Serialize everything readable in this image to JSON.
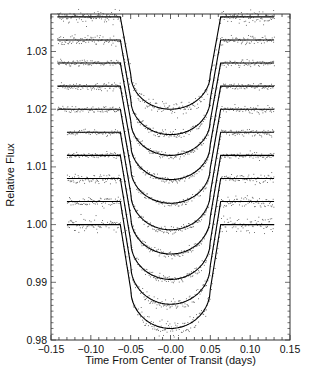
{
  "chart_data": {
    "type": "line",
    "title": "",
    "xlabel": "Time From Center of Transit (days)",
    "ylabel": "Relative Flux",
    "xlim": [
      -0.15,
      0.15
    ],
    "ylim": [
      0.98,
      1.0365
    ],
    "xticks": [
      -0.15,
      -0.1,
      -0.05,
      0.0,
      0.05,
      0.1,
      0.15
    ],
    "xtick_labels": [
      "−0.15",
      "−0.10",
      "−0.05",
      "−0.00",
      "0.05",
      "0.10",
      "0.15"
    ],
    "yticks": [
      0.98,
      0.99,
      1.0,
      1.01,
      1.02,
      1.03
    ],
    "ytick_labels": [
      "0.98",
      "0.99",
      "1.00",
      "1.01",
      "1.02",
      "1.03"
    ],
    "grid": false,
    "legend": "none",
    "transit": {
      "ingress_start": -0.063,
      "full_start": -0.05,
      "full_end": 0.05,
      "egress_end": 0.063
    },
    "series": [
      {
        "name": "light curve 1",
        "baseline": 1.036,
        "minimum": 1.02,
        "x_start": -0.142,
        "x_end": 0.13,
        "noise": 0.0006
      },
      {
        "name": "light curve 2",
        "baseline": 1.032,
        "minimum": 1.0156,
        "x_start": -0.142,
        "x_end": 0.13,
        "noise": 0.0004
      },
      {
        "name": "light curve 3",
        "baseline": 1.028,
        "minimum": 1.012,
        "x_start": -0.142,
        "x_end": 0.13,
        "noise": 0.0003
      },
      {
        "name": "light curve 4",
        "baseline": 1.024,
        "minimum": 1.0078,
        "x_start": -0.142,
        "x_end": 0.13,
        "noise": 0.0003
      },
      {
        "name": "light curve 5",
        "baseline": 1.02,
        "minimum": 1.0037,
        "x_start": -0.142,
        "x_end": 0.13,
        "noise": 0.0003
      },
      {
        "name": "light curve 6",
        "baseline": 1.016,
        "minimum": 0.9991,
        "x_start": -0.13,
        "x_end": 0.13,
        "noise": 0.0003
      },
      {
        "name": "light curve 7",
        "baseline": 1.012,
        "minimum": 0.9949,
        "x_start": -0.13,
        "x_end": 0.13,
        "noise": 0.0003
      },
      {
        "name": "light curve 8",
        "baseline": 1.008,
        "minimum": 0.9905,
        "x_start": -0.13,
        "x_end": 0.13,
        "noise": 0.0004
      },
      {
        "name": "light curve 9",
        "baseline": 1.004,
        "minimum": 0.9862,
        "x_start": -0.13,
        "x_end": 0.13,
        "noise": 0.0005
      },
      {
        "name": "light curve 10",
        "baseline": 1.0,
        "minimum": 0.982,
        "x_start": -0.13,
        "x_end": 0.13,
        "noise": 0.0007
      }
    ]
  },
  "labels": {
    "xlabel": "Time From Center of Transit (days)",
    "ylabel": "Relative Flux",
    "caption_fragment": "Figure 1: Transits of HD 209458 in different HST bandpasses..."
  },
  "style": {
    "line_color": "#000000",
    "point_color": "#555555",
    "axis_color": "#333333"
  }
}
